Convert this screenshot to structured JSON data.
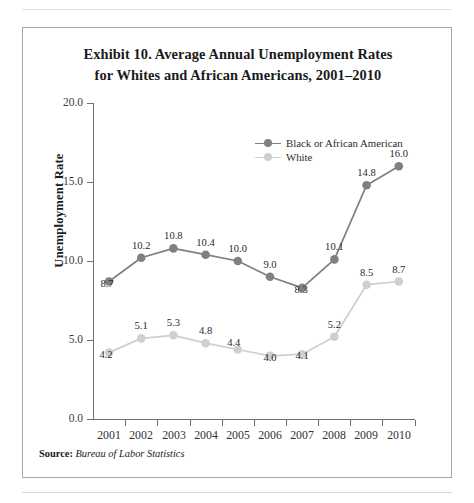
{
  "exhibit": {
    "title_line1": "Exhibit 10. Average Annual Unemployment Rates",
    "title_line2": "for Whites and African Americans, 2001–2010",
    "source_label": "Source:",
    "source_value": "Bureau of Labor Statistics"
  },
  "legend": {
    "items": [
      {
        "label": "Black or African American",
        "color": "#808080",
        "marker": "circle-marker"
      },
      {
        "label": "White",
        "color": "#cfcfcf",
        "marker": "circle-marker"
      }
    ]
  },
  "axes": {
    "y_label": "Unemployment Rate",
    "y_ticks": [
      "0.0",
      "5.0",
      "10.0",
      "15.0",
      "20.0"
    ],
    "x_ticks": [
      "2001",
      "2002",
      "2003",
      "2004",
      "2005",
      "2006",
      "2007",
      "2008",
      "2009",
      "2010"
    ]
  },
  "chart_data": {
    "type": "line",
    "title": "Exhibit 10. Average Annual Unemployment Rates for Whites and African Americans, 2001–2010",
    "xlabel": "",
    "ylabel": "Unemployment Rate",
    "categories": [
      "2001",
      "2002",
      "2003",
      "2004",
      "2005",
      "2006",
      "2007",
      "2008",
      "2009",
      "2010"
    ],
    "series": [
      {
        "name": "Black or African American",
        "color": "#808080",
        "values": [
          8.7,
          10.2,
          10.8,
          10.4,
          10.0,
          9.0,
          8.3,
          10.1,
          14.8,
          16.0
        ],
        "labels": [
          "8.7",
          "10.2",
          "10.8",
          "10.4",
          "10.0",
          "9.0",
          "8.3",
          "10.1",
          "14.8",
          "16.0"
        ]
      },
      {
        "name": "White",
        "color": "#cfcfcf",
        "values": [
          4.2,
          5.1,
          5.3,
          4.8,
          4.4,
          4.0,
          4.1,
          5.2,
          8.5,
          8.7
        ],
        "labels": [
          "4.2",
          "5.1",
          "5.3",
          "4.8",
          "4.4",
          "4.0",
          "4.1",
          "5.2",
          "8.5",
          "8.7"
        ]
      }
    ],
    "ylim": [
      0,
      20
    ],
    "yticks": [
      0,
      5,
      10,
      15,
      20
    ],
    "ytick_labels": [
      "0.0",
      "5.0",
      "10.0",
      "15.0",
      "20.0"
    ],
    "grid": false,
    "legend_position": "upper-center",
    "data_labels": true,
    "source": "Bureau of Labor Statistics"
  }
}
